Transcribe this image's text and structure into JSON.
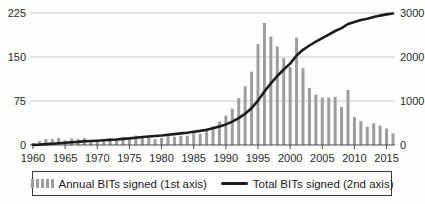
{
  "chart_data": {
    "type": "bar",
    "subtype": "bar-line-combo",
    "title": "",
    "xlabel": "",
    "ylabel_left": "",
    "ylabel_right": "",
    "years": [
      1960,
      1961,
      1962,
      1963,
      1964,
      1965,
      1966,
      1967,
      1968,
      1969,
      1970,
      1971,
      1972,
      1973,
      1974,
      1975,
      1976,
      1977,
      1978,
      1979,
      1980,
      1981,
      1982,
      1983,
      1984,
      1985,
      1986,
      1987,
      1988,
      1989,
      1990,
      1991,
      1992,
      1993,
      1994,
      1995,
      1996,
      1997,
      1998,
      1999,
      2000,
      2001,
      2002,
      2003,
      2004,
      2005,
      2006,
      2007,
      2008,
      2009,
      2010,
      2011,
      2012,
      2013,
      2014,
      2015,
      2016
    ],
    "series": [
      {
        "name": "Annual BITs signed (1st axis)",
        "render": "bar",
        "axis": "left",
        "color": "#9e9e9e",
        "values": [
          3,
          7,
          10,
          10,
          12,
          8,
          11,
          10,
          12,
          8,
          6,
          9,
          11,
          8,
          13,
          13,
          16,
          14,
          13,
          10,
          12,
          18,
          14,
          16,
          16,
          22,
          19,
          26,
          32,
          40,
          50,
          62,
          80,
          100,
          125,
          172,
          208,
          185,
          168,
          148,
          133,
          183,
          131,
          97,
          86,
          81,
          81,
          82,
          65,
          94,
          48,
          41,
          31,
          37,
          33,
          28,
          20
        ]
      },
      {
        "name": "Total BITs signed (2nd axis)",
        "render": "line",
        "axis": "right",
        "color": "#1c1c1c",
        "values": [
          3,
          10,
          20,
          30,
          42,
          50,
          61,
          71,
          83,
          91,
          97,
          106,
          117,
          125,
          138,
          151,
          167,
          181,
          194,
          204,
          216,
          234,
          248,
          264,
          280,
          302,
          321,
          347,
          379,
          419,
          469,
          531,
          611,
          711,
          836,
          1008,
          1216,
          1401,
          1569,
          1717,
          1850,
          2033,
          2164,
          2261,
          2347,
          2428,
          2509,
          2591,
          2656,
          2750,
          2798,
          2839,
          2870,
          2907,
          2940,
          2968,
          2988
        ]
      }
    ],
    "left_axis": {
      "ticks": [
        0,
        75,
        150,
        225
      ],
      "range": [
        0,
        225
      ]
    },
    "right_axis": {
      "ticks": [
        0,
        1000,
        2000,
        3000
      ],
      "range": [
        0,
        3000
      ]
    },
    "x_ticks": [
      1960,
      1965,
      1970,
      1975,
      1980,
      1985,
      1990,
      1995,
      2000,
      2005,
      2010,
      2015
    ],
    "grid": "horizontal",
    "legend_position": "bottom-boxed"
  },
  "legend": {
    "items": [
      {
        "label": "Annual BITs signed (1st axis)",
        "swatch": "gray-bars"
      },
      {
        "label": "Total BITs signed (2nd axis)",
        "swatch": "black-line"
      }
    ]
  },
  "colors": {
    "bars": "#9e9e9e",
    "line": "#1c1c1c",
    "gridline": "#c8c8c8",
    "axis": "#4a4a4a",
    "text": "#2a2a2a",
    "legend_border": "#3c3c3c",
    "background": "#fefefe"
  }
}
